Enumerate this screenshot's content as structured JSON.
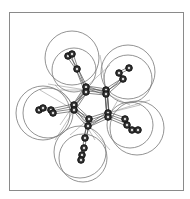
{
  "figure": {
    "frame": {
      "x": 9,
      "y": 12,
      "w": 174,
      "h": 178,
      "stroke": "#8a8a8a"
    },
    "colors": {
      "atom_fill": "#333333",
      "atom_stroke": "#111111",
      "atom_highlight": "#dddddd",
      "bond": "#555555",
      "sphere": "#777777",
      "net": "#999999"
    },
    "spheres": [
      {
        "cx": 72,
        "cy": 58,
        "r": 27
      },
      {
        "cx": 74,
        "cy": 70,
        "r": 22
      },
      {
        "cx": 128,
        "cy": 72,
        "r": 27
      },
      {
        "cx": 128,
        "cy": 79,
        "r": 24
      },
      {
        "cx": 43,
        "cy": 113,
        "r": 27
      },
      {
        "cx": 48,
        "cy": 113,
        "r": 25
      },
      {
        "cx": 80,
        "cy": 152,
        "r": 26
      },
      {
        "cx": 83,
        "cy": 158,
        "r": 24
      },
      {
        "cx": 137,
        "cy": 128,
        "r": 27
      },
      {
        "cx": 130,
        "cy": 125,
        "r": 23
      }
    ],
    "atoms": [
      {
        "x": 68,
        "y": 56
      },
      {
        "x": 72,
        "y": 54
      },
      {
        "x": 77,
        "y": 69
      },
      {
        "x": 86,
        "y": 87
      },
      {
        "x": 86,
        "y": 92
      },
      {
        "x": 129,
        "y": 68
      },
      {
        "x": 119,
        "y": 73
      },
      {
        "x": 123,
        "y": 79
      },
      {
        "x": 106,
        "y": 90
      },
      {
        "x": 106,
        "y": 94
      },
      {
        "x": 39,
        "y": 110
      },
      {
        "x": 43,
        "y": 108
      },
      {
        "x": 51,
        "y": 110
      },
      {
        "x": 53,
        "y": 113
      },
      {
        "x": 74,
        "y": 105
      },
      {
        "x": 74,
        "y": 110
      },
      {
        "x": 108,
        "y": 113
      },
      {
        "x": 108,
        "y": 117
      },
      {
        "x": 125,
        "y": 119
      },
      {
        "x": 127,
        "y": 125
      },
      {
        "x": 132,
        "y": 130
      },
      {
        "x": 138,
        "y": 130
      },
      {
        "x": 89,
        "y": 119
      },
      {
        "x": 88,
        "y": 126
      },
      {
        "x": 85,
        "y": 138
      },
      {
        "x": 84,
        "y": 148
      },
      {
        "x": 82,
        "y": 155
      },
      {
        "x": 81,
        "y": 160
      }
    ],
    "bonds": [
      [
        2,
        3
      ],
      [
        2,
        4
      ],
      [
        0,
        2
      ],
      [
        1,
        2
      ],
      [
        7,
        8
      ],
      [
        7,
        9
      ],
      [
        5,
        6
      ],
      [
        6,
        7
      ],
      [
        12,
        14
      ],
      [
        13,
        15
      ],
      [
        10,
        11
      ],
      [
        11,
        12
      ],
      [
        16,
        18
      ],
      [
        17,
        19
      ],
      [
        18,
        19
      ],
      [
        19,
        20
      ],
      [
        20,
        21
      ],
      [
        22,
        24
      ],
      [
        23,
        24
      ],
      [
        24,
        25
      ],
      [
        25,
        26
      ],
      [
        26,
        27
      ],
      [
        3,
        8
      ],
      [
        4,
        9
      ],
      [
        8,
        16
      ],
      [
        9,
        17
      ],
      [
        16,
        22
      ],
      [
        17,
        23
      ],
      [
        22,
        14
      ],
      [
        23,
        15
      ],
      [
        14,
        3
      ],
      [
        15,
        4
      ],
      [
        3,
        9
      ],
      [
        8,
        17
      ],
      [
        16,
        23
      ],
      [
        22,
        15
      ],
      [
        14,
        4
      ]
    ],
    "net_lines": [
      [
        48,
        84,
        86,
        90
      ],
      [
        100,
        55,
        106,
        90
      ],
      [
        108,
        113,
        150,
        100
      ],
      [
        89,
        126,
        110,
        150
      ],
      [
        74,
        110,
        55,
        140
      ],
      [
        60,
        90,
        106,
        90
      ],
      [
        118,
        100,
        108,
        117
      ],
      [
        74,
        105,
        95,
        140
      ],
      [
        86,
        87,
        60,
        125
      ],
      [
        106,
        94,
        130,
        105
      ],
      [
        55,
        85,
        74,
        105
      ],
      [
        110,
        65,
        86,
        87
      ],
      [
        140,
        105,
        108,
        113
      ],
      [
        70,
        135,
        89,
        119
      ],
      [
        40,
        90,
        74,
        110
      ]
    ]
  }
}
